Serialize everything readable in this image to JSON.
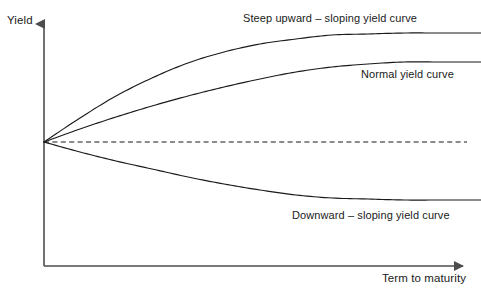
{
  "chart_data": {
    "type": "line",
    "title": "",
    "xlabel": "Term to maturity",
    "ylabel": "Yield",
    "grid": false,
    "legend_position": "inline-annotations",
    "axes": {
      "origin": [
        44,
        266
      ],
      "y_axis_top": [
        44,
        16
      ],
      "x_axis_right": [
        472,
        266
      ],
      "curve_origin": [
        44,
        142
      ],
      "x_arrow": true,
      "y_arrow": true,
      "tick_labels_x": [],
      "tick_labels_y": [],
      "xlim_label": "",
      "ylim_label": ""
    },
    "series": [
      {
        "name": "Steep upward – sloping yield curve",
        "style": "solid",
        "color": "#1a1a1a",
        "points": [
          [
            44,
            142
          ],
          [
            80,
            118
          ],
          [
            116,
            96
          ],
          [
            152,
            78
          ],
          [
            188,
            63
          ],
          [
            224,
            52
          ],
          [
            260,
            44
          ],
          [
            296,
            39
          ],
          [
            332,
            35
          ],
          [
            368,
            34
          ],
          [
            404,
            33
          ],
          [
            440,
            33
          ],
          [
            481,
            33
          ]
        ]
      },
      {
        "name": "Normal yield curve",
        "style": "solid",
        "color": "#1a1a1a",
        "points": [
          [
            44,
            142
          ],
          [
            80,
            129
          ],
          [
            116,
            117
          ],
          [
            152,
            106
          ],
          [
            188,
            96
          ],
          [
            224,
            87
          ],
          [
            260,
            79
          ],
          [
            296,
            72
          ],
          [
            332,
            67
          ],
          [
            368,
            64
          ],
          [
            404,
            62
          ],
          [
            440,
            62
          ],
          [
            481,
            62
          ]
        ]
      },
      {
        "name": "Flat yield curve",
        "style": "dashed",
        "color": "#1a1a1a",
        "points": [
          [
            44,
            142
          ],
          [
            467,
            142
          ]
        ]
      },
      {
        "name": "Downward – sloping yield curve",
        "style": "solid",
        "color": "#1a1a1a",
        "points": [
          [
            44,
            142
          ],
          [
            80,
            152
          ],
          [
            116,
            161
          ],
          [
            152,
            169
          ],
          [
            188,
            177
          ],
          [
            224,
            184
          ],
          [
            260,
            190
          ],
          [
            296,
            195
          ],
          [
            332,
            198
          ],
          [
            368,
            199
          ],
          [
            404,
            200
          ],
          [
            440,
            200
          ],
          [
            481,
            200
          ]
        ]
      }
    ],
    "annotations": [
      {
        "id": "steep-label",
        "text": "Steep upward – sloping yield curve",
        "x": 243,
        "y": 12
      },
      {
        "id": "normal-label",
        "text": "Normal yield curve",
        "x": 361,
        "y": 68
      },
      {
        "id": "downward-label",
        "text": "Downward – sloping yield curve",
        "x": 292,
        "y": 209
      }
    ]
  },
  "labels": {
    "y_axis": "Yield",
    "x_axis": "Term to maturity",
    "steep_curve": "Steep upward – sloping yield curve",
    "normal_curve": "Normal yield curve",
    "downward_curve": "Downward – sloping yield curve"
  },
  "colors": {
    "background": "#ffffff",
    "axis": "#4d4d4d",
    "curve": "#1a1a1a",
    "text": "#1a1a1a"
  }
}
